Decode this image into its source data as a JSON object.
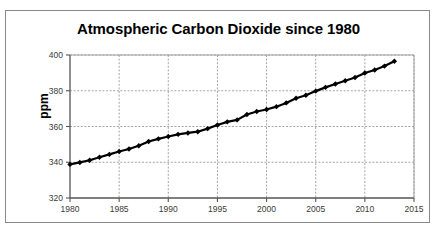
{
  "chart_data": {
    "type": "line",
    "title": "Atmospheric Carbon Dioxide since 1980",
    "xlabel": "",
    "ylabel": "ppm",
    "xlim": [
      1980,
      2015
    ],
    "ylim": [
      320,
      400
    ],
    "xticks": [
      1980,
      1985,
      1990,
      1995,
      2000,
      2005,
      2010,
      2015
    ],
    "yticks": [
      320,
      340,
      360,
      380,
      400
    ],
    "grid": true,
    "legend": false,
    "marker": "diamond",
    "line_color": "#000000",
    "marker_color": "#000000",
    "x": [
      1980,
      1981,
      1982,
      1983,
      1984,
      1985,
      1986,
      1987,
      1988,
      1989,
      1990,
      1991,
      1992,
      1993,
      1994,
      1995,
      1996,
      1997,
      1998,
      1999,
      2000,
      2001,
      2002,
      2003,
      2004,
      2005,
      2006,
      2007,
      2008,
      2009,
      2010,
      2011,
      2012,
      2013
    ],
    "values": [
      338.8,
      339.9,
      341.1,
      342.8,
      344.4,
      346.0,
      347.4,
      349.2,
      351.6,
      353.1,
      354.4,
      355.6,
      356.4,
      357.1,
      358.8,
      360.8,
      362.6,
      363.7,
      366.7,
      368.4,
      369.5,
      371.1,
      373.2,
      375.8,
      377.5,
      379.8,
      381.9,
      383.8,
      385.6,
      387.4,
      389.9,
      391.6,
      393.8,
      396.5
    ],
    "series_name": "Atmospheric CO2"
  },
  "chart": {
    "title": "Atmospheric Carbon Dioxide since 1980",
    "y_axis_title": "ppm",
    "y_tick_labels": [
      "400",
      "380",
      "360",
      "340",
      "320"
    ],
    "x_tick_labels": [
      "1980",
      "1985",
      "1990",
      "1995",
      "2000",
      "2005",
      "2010",
      "2015"
    ]
  }
}
